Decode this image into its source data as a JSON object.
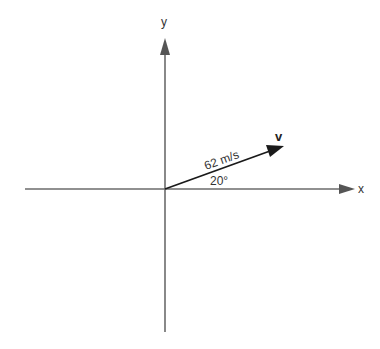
{
  "diagram": {
    "type": "vector-on-axes",
    "colors": {
      "axis": "#6b6b6b",
      "vector": "#1a1a1a",
      "text": "#333333",
      "background": "#ffffff"
    },
    "axes": {
      "x_label": "x",
      "y_label": "y"
    },
    "vector": {
      "name": "v",
      "magnitude_label": "62 m/s",
      "angle_label": "20°",
      "angle_deg": 20
    }
  }
}
